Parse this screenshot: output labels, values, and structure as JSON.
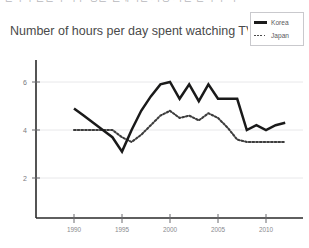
{
  "top_strip": {
    "text": "한국과 일본의 하루 평균 텔레비전 시청 시간 변화 추이"
  },
  "legend": {
    "position": "top-right",
    "boxed": true,
    "entries": [
      {
        "label": "Korea",
        "style": "solid",
        "color": "#1a1a1a",
        "icon": "line-swatch-solid-icon"
      },
      {
        "label": "Japan",
        "style": "dotted",
        "color": "#3d3d3d",
        "icon": "line-swatch-dotted-icon"
      }
    ]
  },
  "chart_data": {
    "type": "line",
    "title": "Number of hours per day spent watching TV in",
    "subtitle": "",
    "xlabel": "",
    "ylabel": "",
    "xlim": [
      1989,
      2013
    ],
    "ylim": [
      0,
      7
    ],
    "grid": true,
    "y_ticks": [
      6,
      4,
      2
    ],
    "y_tick_labels": [
      "6",
      "4",
      "2"
    ],
    "x_ticks": [
      1990,
      1995,
      2000,
      2005,
      2010
    ],
    "x_tick_labels": [
      "1990",
      "1995",
      "2000",
      "2005",
      "2010"
    ],
    "legend_position": "top-right",
    "series": [
      {
        "name": "Korea",
        "style": "solid",
        "color": "#1a1a1a",
        "x": [
          1990,
          1991,
          1992,
          1993,
          1994,
          1995,
          1996,
          1997,
          1998,
          1999,
          2000,
          2001,
          2002,
          2003,
          2004,
          2005,
          2006,
          2007,
          2008,
          2009,
          2010,
          2011,
          2012
        ],
        "values": [
          4.9,
          4.6,
          4.3,
          4.0,
          3.7,
          3.1,
          4.0,
          4.8,
          5.4,
          5.9,
          6.0,
          5.3,
          5.9,
          5.2,
          5.9,
          5.3,
          5.3,
          5.3,
          4.0,
          4.2,
          4.0,
          4.2,
          4.3
        ]
      },
      {
        "name": "Japan",
        "style": "dotted",
        "color": "#3d3d3d",
        "x": [
          1990,
          1991,
          1992,
          1993,
          1994,
          1995,
          1996,
          1997,
          1998,
          1999,
          2000,
          2001,
          2002,
          2003,
          2004,
          2005,
          2006,
          2007,
          2008,
          2009,
          2010,
          2011,
          2012
        ],
        "values": [
          4.0,
          4.0,
          4.0,
          4.0,
          4.0,
          3.7,
          3.5,
          3.8,
          4.2,
          4.6,
          4.8,
          4.5,
          4.6,
          4.4,
          4.7,
          4.5,
          4.1,
          3.6,
          3.5,
          3.5,
          3.5,
          3.5,
          3.5
        ]
      }
    ]
  }
}
